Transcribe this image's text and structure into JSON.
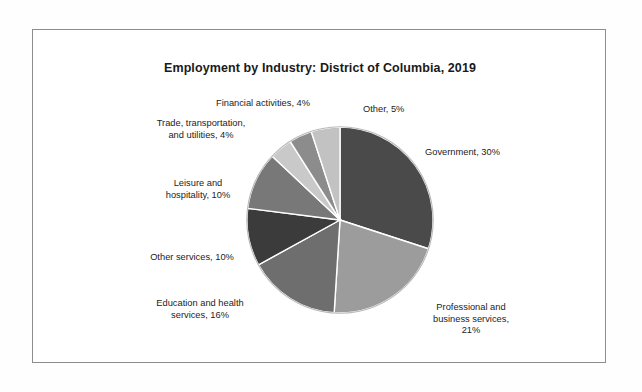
{
  "chart_data": {
    "type": "pie",
    "title": "Employment by Industry: District of Columbia, 2019",
    "xlabel": "",
    "ylabel": "",
    "legend_position": "none",
    "grid": false,
    "labels_format": "{name}, {value}%",
    "categories": [
      "Government",
      "Professional and business services",
      "Education and health services",
      "Other services",
      "Leisure and hospitality",
      "Trade, transportation, and utilities",
      "Financial activities",
      "Other"
    ],
    "values": [
      30,
      21,
      16,
      10,
      10,
      4,
      4,
      5
    ],
    "slices": [
      {
        "name": "Government",
        "value": 30,
        "label": "Government, 30%",
        "color": "#4a4a4a",
        "start_angle": 0,
        "end_angle": 108
      },
      {
        "name": "Professional and business services",
        "value": 21,
        "label": "Professional and\nbusiness services,\n21%",
        "color": "#9c9c9c",
        "start_angle": 108,
        "end_angle": 183.6
      },
      {
        "name": "Education and health services",
        "value": 16,
        "label": "Education and health\nservices, 16%",
        "color": "#6e6e6e",
        "start_angle": 183.6,
        "end_angle": 241.2
      },
      {
        "name": "Other services",
        "value": 10,
        "label": "Other services, 10%",
        "color": "#3b3b3b",
        "start_angle": 241.2,
        "end_angle": 277.2
      },
      {
        "name": "Leisure and hospitality",
        "value": 10,
        "label": "Leisure and\nhospitality, 10%",
        "color": "#787878",
        "start_angle": 277.2,
        "end_angle": 313.2
      },
      {
        "name": "Trade, transportation, and utilities",
        "value": 4,
        "label": "Trade, transportation,\nand utilities, 4%",
        "color": "#c9c9c9",
        "start_angle": 313.2,
        "end_angle": 327.6
      },
      {
        "name": "Financial activities",
        "value": 4,
        "label": "Financial activities, 4%",
        "color": "#8c8c8c",
        "start_angle": 327.6,
        "end_angle": 342
      },
      {
        "name": "Other",
        "value": 5,
        "label": "Other, 5%",
        "color": "#c2c2c2",
        "start_angle": 342,
        "end_angle": 360
      }
    ],
    "total": 100,
    "units": "percent",
    "slice_border_color": "#ffffff",
    "pie_outline_color": "#b4b4b4"
  },
  "frame": {
    "border_color": "#8d8d8d"
  },
  "labels": {
    "financial": "Financial activities, 4%",
    "other": "Other, 5%",
    "trade": "Trade, transportation,\nand utilities, 4%",
    "leisure": "Leisure and\nhospitality, 10%",
    "other_services": "Other services, 10%",
    "education": "Education and health\nservices, 16%",
    "professional": "Professional and\nbusiness services,\n21%",
    "government": "Government, 30%"
  }
}
